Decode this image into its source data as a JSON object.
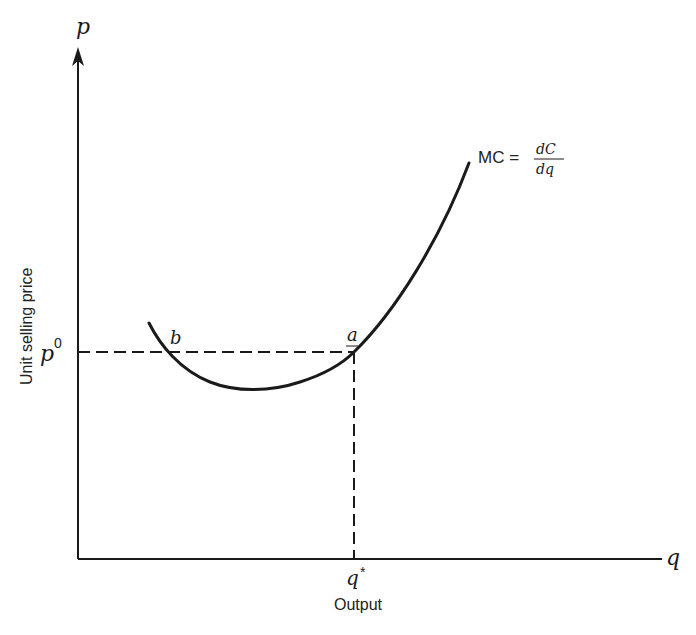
{
  "diagram": {
    "type": "economics-cost-curve",
    "y_axis": {
      "symbol": "p",
      "label": "Unit selling price"
    },
    "x_axis": {
      "symbol": "q",
      "label": "Output"
    },
    "curve": {
      "name": "MC",
      "label_lhs": "MC =",
      "label_numerator": "dC",
      "label_denominator": "dq"
    },
    "price_level": {
      "label": "p",
      "superscript": "0"
    },
    "quantity_level": {
      "label": "q",
      "superscript": "*"
    },
    "points": [
      {
        "id": "b",
        "label": "b"
      },
      {
        "id": "a",
        "label": "a"
      }
    ]
  },
  "colors": {
    "ink": "#1a1a1a",
    "background": "#ffffff"
  }
}
